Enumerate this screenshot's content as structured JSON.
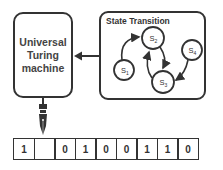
{
  "machine": {
    "label": "Universal\nTuring\nmachine"
  },
  "state_panel": {
    "title": "State Transition",
    "states": [
      {
        "id": "S1",
        "base": "S",
        "sub": "1"
      },
      {
        "id": "S2",
        "base": "S",
        "sub": "2"
      },
      {
        "id": "S3",
        "base": "S",
        "sub": "3"
      },
      {
        "id": "S4",
        "base": "S",
        "sub": "4"
      }
    ],
    "transitions": [
      {
        "from": "S1",
        "to": "S2"
      },
      {
        "from": "S2",
        "to": "S3"
      },
      {
        "from": "S3",
        "to": "S2"
      },
      {
        "from": "S4",
        "to": "S3"
      }
    ]
  },
  "tape": {
    "cells": [
      "1",
      "",
      "0",
      "1",
      "0",
      "0",
      "1",
      "1",
      "0"
    ]
  },
  "colors": {
    "stroke": "#333333",
    "background": "#ffffff"
  }
}
